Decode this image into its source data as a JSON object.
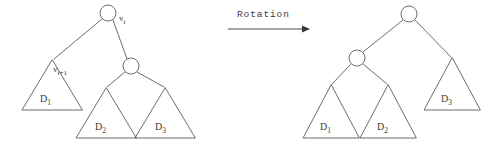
{
  "figure": {
    "kind": "binary-tree-rotation-diagram",
    "background_color": "#ffffff",
    "line_color": "#5c5c5c",
    "text_color": "#3b3b3b"
  },
  "transform": {
    "label": "Rotation",
    "arrow": "rightwards-arrow"
  },
  "left_tree": {
    "nodes": [
      {
        "id": "root",
        "label_base": "v",
        "label_sub": "i",
        "cx": 108,
        "cy": 13,
        "r": 8
      },
      {
        "id": "child",
        "label_base": "",
        "label_sub": "",
        "cx": 131,
        "cy": 66,
        "r": 8
      }
    ],
    "subtree_apex_label": {
      "base": "v",
      "sub": "i+1"
    },
    "subtrees": [
      {
        "name": "D",
        "sub": "1",
        "apex_x": 52,
        "apex_y": 60,
        "base_y": 110,
        "half_width": 30
      },
      {
        "name": "D",
        "sub": "2",
        "apex_x": 106,
        "apex_y": 88,
        "base_y": 138,
        "half_width": 30
      },
      {
        "name": "D",
        "sub": "3",
        "apex_x": 165,
        "apex_y": 88,
        "base_y": 138,
        "half_width": 30
      }
    ]
  },
  "right_tree": {
    "nodes": [
      {
        "id": "root",
        "label_base": "",
        "label_sub": "",
        "cx": 409,
        "cy": 14,
        "r": 8
      },
      {
        "id": "child",
        "label_base": "",
        "label_sub": "",
        "cx": 357,
        "cy": 58,
        "r": 8
      }
    ],
    "subtrees": [
      {
        "name": "D",
        "sub": "1",
        "apex_x": 331,
        "apex_y": 85,
        "base_y": 138,
        "half_width": 28
      },
      {
        "name": "D",
        "sub": "2",
        "apex_x": 388,
        "apex_y": 85,
        "base_y": 138,
        "half_width": 28
      },
      {
        "name": "D",
        "sub": "3",
        "apex_x": 452,
        "apex_y": 58,
        "base_y": 110,
        "half_width": 28
      }
    ]
  }
}
